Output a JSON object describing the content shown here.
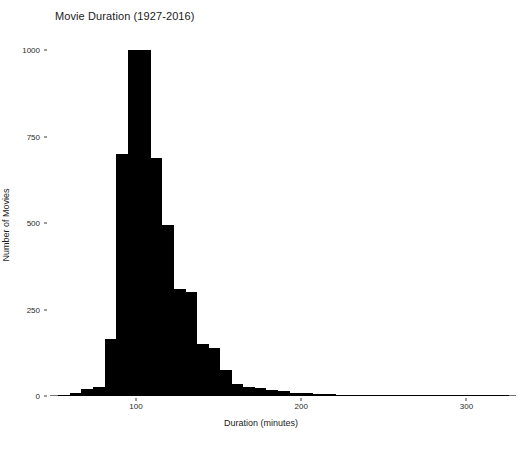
{
  "chart_data": {
    "type": "bar",
    "title": "Movie Duration (1927-2016)",
    "xlabel": "Duration (minutes)",
    "ylabel": "Number of Movies",
    "grid": false,
    "legend": null,
    "xlim": [
      48,
      330
    ],
    "ylim": [
      0,
      1030
    ],
    "xticks": [
      100,
      200,
      300
    ],
    "xtick_labels": [
      "100",
      "200",
      "300"
    ],
    "yticks": [
      0,
      250,
      500,
      750,
      1000
    ],
    "ytick_labels": [
      "0",
      "250",
      "500",
      "750",
      "1000"
    ],
    "bin_width": 7,
    "bar_color": "#000000",
    "bin_starts": [
      53,
      60,
      67,
      74,
      81,
      88,
      95,
      102,
      109,
      116,
      123,
      130,
      137,
      144,
      151,
      158,
      165,
      172,
      179,
      186,
      193,
      200,
      207,
      214,
      221,
      228,
      235,
      242,
      249,
      256,
      263,
      270,
      277,
      284,
      291,
      298,
      305,
      312,
      319
    ],
    "categories": [
      "53-60",
      "60-67",
      "67-74",
      "74-81",
      "81-88",
      "88-95",
      "95-102",
      "102-109",
      "109-116",
      "116-123",
      "123-130",
      "130-137",
      "137-144",
      "144-151",
      "151-158",
      "158-165",
      "165-172",
      "172-179",
      "179-186",
      "186-193",
      "193-200",
      "200-207",
      "207-214",
      "214-221",
      "221-228",
      "228-235",
      "235-242",
      "242-249",
      "249-256",
      "256-263",
      "263-270",
      "270-277",
      "277-284",
      "284-291",
      "291-298",
      "298-305",
      "305-312",
      "312-319",
      "319-326"
    ],
    "values": [
      3,
      8,
      20,
      25,
      165,
      700,
      1000,
      1000,
      690,
      495,
      310,
      300,
      150,
      140,
      75,
      35,
      25,
      22,
      18,
      14,
      10,
      8,
      6,
      5,
      4,
      3,
      2,
      2,
      2,
      1,
      1,
      0,
      1,
      0,
      0,
      1,
      0,
      0,
      1
    ],
    "peak_value": 1000,
    "peak_bin": "95-109",
    "n_bins": 39
  },
  "axes": {
    "title": "Movie Duration (1927-2016)",
    "x_axis_title": "Duration (minutes)",
    "y_axis_title": "Number of Movies"
  }
}
